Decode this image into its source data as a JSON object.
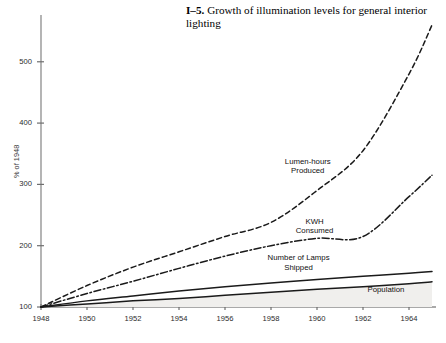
{
  "caption": {
    "figure_number": "I–5.",
    "text": "Growth of illumination levels for general interior lighting"
  },
  "chart_data": {
    "type": "line",
    "title": "Growth of illumination levels for general interior lighting",
    "xlabel": "",
    "ylabel": "% of 1948",
    "xlim": [
      1948,
      1965
    ],
    "ylim": [
      100,
      560
    ],
    "grid": false,
    "legend_position": "inline-annotations",
    "xticks": [
      1948,
      1950,
      1952,
      1954,
      1956,
      1958,
      1960,
      1962,
      1964
    ],
    "xtick_labels": [
      "1948",
      "1950",
      "1952",
      "1954",
      "1956",
      "1958",
      "1960",
      "1962",
      "1964"
    ],
    "yticks": [
      100,
      200,
      300,
      400,
      500
    ],
    "ytick_labels": [
      "100",
      "200",
      "300",
      "400",
      "500"
    ],
    "x": [
      1948,
      1950,
      1952,
      1954,
      1956,
      1958,
      1960,
      1962,
      1964,
      1965
    ],
    "series": [
      {
        "name": "Lumen-hours Produced",
        "style": "dashed",
        "color": "#1a1a1a",
        "values": [
          100,
          135,
          165,
          190,
          215,
          238,
          290,
          355,
          480,
          560
        ]
      },
      {
        "name": "KWH Consumed",
        "style": "dash-dot",
        "color": "#1a1a1a",
        "values": [
          100,
          122,
          142,
          163,
          183,
          200,
          212,
          215,
          280,
          315
        ]
      },
      {
        "name": "Number of Lamps Shipped",
        "style": "solid",
        "color": "#1a1a1a",
        "values": [
          100,
          110,
          118,
          126,
          133,
          139,
          145,
          150,
          155,
          158
        ]
      },
      {
        "name": "Population",
        "style": "solid-filled",
        "color": "#1a1a1a",
        "fill": "#f0efed",
        "values": [
          100,
          105,
          110,
          114,
          119,
          124,
          129,
          133,
          138,
          141
        ]
      }
    ],
    "annotations": [
      {
        "label": "Lumen-hours Produced",
        "x": 1959.6,
        "y": 330
      },
      {
        "label": "KWH Consumed",
        "x": 1959.9,
        "y": 232
      },
      {
        "label": "Number of Lamps Shipped",
        "x": 1959.2,
        "y": 172
      },
      {
        "label": "Population",
        "x": 1963.0,
        "y": 128
      }
    ]
  },
  "axis": {
    "y_title": "% of 1948"
  }
}
